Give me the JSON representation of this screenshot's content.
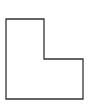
{
  "diagram": {
    "shape": "L-shape outline",
    "stroke_color": "#333333",
    "fill_color": "#ffffff",
    "points": [
      [
        6,
        19
      ],
      [
        44,
        19
      ],
      [
        44,
        59
      ],
      [
        83,
        59
      ],
      [
        83,
        99
      ],
      [
        6,
        99
      ]
    ]
  }
}
